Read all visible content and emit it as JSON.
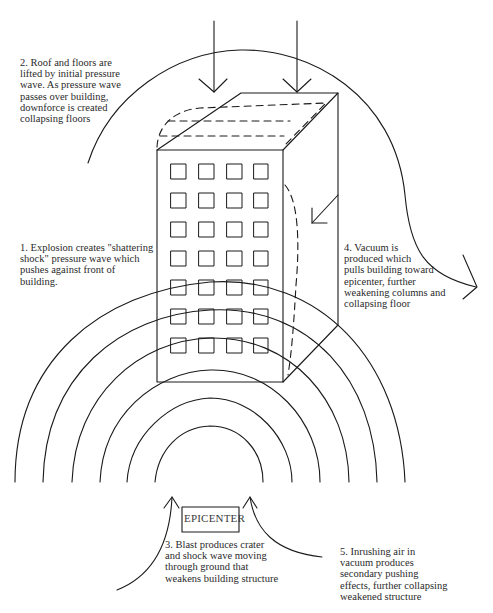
{
  "diagram": {
    "type": "explosion-effects-on-building",
    "epicenter_label": "EPICENTER",
    "annotations": [
      {
        "id": "step-1",
        "number": "1.",
        "text": "1. Explosion creates \"shattering\nshock\" pressure wave which\npushes against front of\nbuilding."
      },
      {
        "id": "step-2",
        "number": "2.",
        "text": "2.  Roof and floors are\nlifted by initial pressure\nwave.   As pressure wave\npasses over building,\ndownforce is created\ncollapsing floors"
      },
      {
        "id": "step-3",
        "number": "3.",
        "text": "3.  Blast produces crater\nand shock wave moving\nthrough ground that\nweakens building structure"
      },
      {
        "id": "step-4",
        "number": "4.",
        "text": "4.  Vacuum is\nproduced which\npulls building toward\nepicenter, further\nweakening columns and\ncollapsing floor"
      },
      {
        "id": "step-5",
        "number": "5.",
        "text": "5.  Inrushing air in\nvacuum produces\nsecondary pushing\neffects, further collapsing\nweakened structure"
      }
    ],
    "building": {
      "window_columns": 4,
      "window_rows": 7
    },
    "colors": {
      "line": "#1a1a1a",
      "text": "#2a2a2a",
      "background": "#ffffff"
    }
  }
}
